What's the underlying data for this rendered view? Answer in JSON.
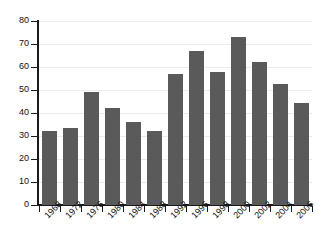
{
  "chart_data": {
    "type": "bar",
    "title": "",
    "subtitle": "",
    "xlabel": "",
    "ylabel": "",
    "categories": [
      "1968",
      "1972",
      "1976",
      "1980",
      "1984",
      "1988",
      "1992",
      "1996",
      "1998",
      "2000",
      "2002",
      "2004",
      "2006"
    ],
    "values": [
      32,
      33.5,
      49,
      42,
      36,
      32,
      57,
      67,
      58,
      73,
      62,
      52.8,
      44.5
    ],
    "series": [
      {
        "name": "",
        "values": [
          32,
          33.5,
          49,
          42,
          36,
          32,
          57,
          67,
          58,
          73,
          62,
          52.8,
          44.5
        ]
      }
    ],
    "ylim": [
      0,
      80
    ],
    "y_ticks": [
      0,
      10,
      20,
      30,
      40,
      50,
      60,
      70,
      80
    ],
    "y_tick_labels": [
      "0",
      "10",
      "20",
      "30",
      "40",
      "50",
      "60",
      "70",
      "80"
    ],
    "x_tick_labels": [
      "1968",
      "1972",
      "1976",
      "1980",
      "1984",
      "1988",
      "1992",
      "1996",
      "1998",
      "2000",
      "2002",
      "2004",
      "2006"
    ],
    "grid": true,
    "grid_axis": "y",
    "legend": false,
    "legend_position": "none",
    "annotations": [],
    "bar_color": "#5a5a5a",
    "grid_color": "#ececec",
    "axis_color": "#1a1a1a",
    "background_color": "#ffffff",
    "x_tick_label_rotation": -45
  }
}
